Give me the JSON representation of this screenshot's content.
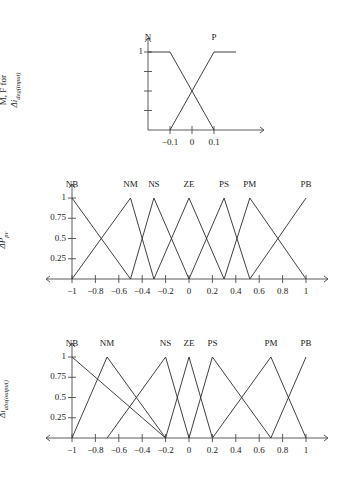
{
  "figure": {
    "background": "#ffffff",
    "line_color": "#2b2b2b",
    "axis_color": "#4a4a4a"
  },
  "chart_data": [
    {
      "type": "line",
      "id": "mf-delta-i-deg-input",
      "title": "",
      "ylabel_line1": "M, F for",
      "ylabel_line2": "Δi",
      "ylabel_line2_sub": "deg(input)",
      "xlabel": "",
      "xlim": [
        -0.2,
        0.2
      ],
      "ylim": [
        0,
        1
      ],
      "yticks": [
        0.25,
        0.5,
        0.75,
        1
      ],
      "ytick_labels": [
        "",
        "",
        "",
        "1"
      ],
      "xticks": [
        -0.1,
        0,
        0.1
      ],
      "xtick_labels": [
        "−0.1",
        "0",
        "0.1"
      ],
      "grid": false,
      "legend": "inline-above-peaks",
      "series": [
        {
          "name": "N",
          "label": "N",
          "points": [
            [
              -0.2,
              1
            ],
            [
              -0.1,
              1
            ],
            [
              0.1,
              0
            ]
          ]
        },
        {
          "name": "P",
          "label": "P",
          "points": [
            [
              -0.1,
              0
            ],
            [
              0.1,
              1
            ],
            [
              0.2,
              1
            ]
          ]
        }
      ]
    },
    {
      "type": "line",
      "id": "mf-delta-p-pv",
      "title": "",
      "ylabel_line1": "M, F for",
      "ylabel_line2": "ΔP",
      "ylabel_line2_sub": "pv",
      "xlabel": "",
      "xlim": [
        -1,
        1
      ],
      "ylim": [
        0,
        1
      ],
      "yticks": [
        0.25,
        0.5,
        0.75,
        1
      ],
      "ytick_labels": [
        "0.25",
        "0.5",
        "0.75",
        "1"
      ],
      "xticks": [
        -1,
        -0.8,
        -0.6,
        -0.4,
        -0.2,
        0,
        0.2,
        0.4,
        0.6,
        0.8,
        1
      ],
      "xtick_labels": [
        "−1",
        "−0.8",
        "−0.6",
        "−0.4",
        "−0.2",
        "0",
        "0.2",
        "0.4",
        "0.6",
        "0.8",
        "1"
      ],
      "grid": false,
      "legend": "inline-above-peaks",
      "series": [
        {
          "name": "NB",
          "label": "NB",
          "points": [
            [
              -1,
              1
            ],
            [
              -0.5,
              0
            ]
          ]
        },
        {
          "name": "NM",
          "label": "NM",
          "points": [
            [
              -1,
              0
            ],
            [
              -0.5,
              1
            ],
            [
              -0.3,
              0
            ]
          ]
        },
        {
          "name": "NS",
          "label": "NS",
          "points": [
            [
              -0.5,
              0
            ],
            [
              -0.3,
              1
            ],
            [
              0,
              0
            ]
          ]
        },
        {
          "name": "ZE",
          "label": "ZE",
          "points": [
            [
              -0.3,
              0
            ],
            [
              0,
              1
            ],
            [
              0.3,
              0
            ]
          ]
        },
        {
          "name": "PS",
          "label": "PS",
          "points": [
            [
              0,
              0
            ],
            [
              0.3,
              1
            ],
            [
              0.52,
              0
            ]
          ]
        },
        {
          "name": "PM",
          "label": "PM",
          "points": [
            [
              0.3,
              0
            ],
            [
              0.52,
              1
            ],
            [
              1,
              0
            ]
          ]
        },
        {
          "name": "PB",
          "label": "PB",
          "points": [
            [
              0.52,
              0
            ],
            [
              1,
              1
            ]
          ]
        }
      ]
    },
    {
      "type": "line",
      "id": "mf-delta-i-abs-output",
      "title": "",
      "ylabel_line1": "M, F for",
      "ylabel_line2": "Δi",
      "ylabel_line2_sub": "abs(output)",
      "xlabel": "",
      "xlim": [
        -1,
        1
      ],
      "ylim": [
        0,
        1
      ],
      "yticks": [
        0.25,
        0.5,
        0.75,
        1
      ],
      "ytick_labels": [
        "0.25",
        "0.5",
        "0.75",
        "1"
      ],
      "xticks": [
        -1,
        -0.8,
        -0.6,
        -0.4,
        -0.2,
        0,
        0.2,
        0.4,
        0.6,
        0.8,
        1
      ],
      "xtick_labels": [
        "−1",
        "−0.8",
        "−0.6",
        "−0.4",
        "−0.2",
        "0",
        "0.2",
        "0.4",
        "0.6",
        "0.8",
        "1"
      ],
      "grid": false,
      "legend": "inline-above-peaks",
      "series": [
        {
          "name": "NB",
          "label": "NB",
          "points": [
            [
              -1,
              1
            ],
            [
              -0.2,
              0
            ]
          ]
        },
        {
          "name": "NM",
          "label": "NM",
          "points": [
            [
              -1,
              0
            ],
            [
              -0.7,
              1
            ],
            [
              -0.2,
              0
            ]
          ]
        },
        {
          "name": "NS",
          "label": "NS",
          "points": [
            [
              -0.7,
              0
            ],
            [
              -0.2,
              1
            ],
            [
              0,
              0
            ]
          ]
        },
        {
          "name": "ZE",
          "label": "ZE",
          "points": [
            [
              -0.2,
              0
            ],
            [
              0,
              1
            ],
            [
              0.2,
              0
            ]
          ]
        },
        {
          "name": "PS",
          "label": "PS",
          "points": [
            [
              0,
              0
            ],
            [
              0.2,
              1
            ],
            [
              0.7,
              0
            ]
          ]
        },
        {
          "name": "PM",
          "label": "PM",
          "points": [
            [
              0.2,
              0
            ],
            [
              0.7,
              1
            ],
            [
              1,
              0
            ]
          ]
        },
        {
          "name": "PB",
          "label": "PB",
          "points": [
            [
              0.7,
              0
            ],
            [
              1,
              1
            ]
          ]
        }
      ]
    }
  ]
}
